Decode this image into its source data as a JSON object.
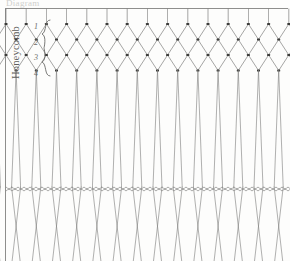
{
  "page": {
    "width": 290,
    "height": 261,
    "background_color": "#fdfdfc",
    "ink_color": "#6b6b69",
    "frame_color": "#8e8e8c"
  },
  "top_caption": {
    "text": "Diagram",
    "note": "faint cropped handwritten text at very top edge"
  },
  "side_label": {
    "text": "Honeycomb",
    "orientation": "vertical-rotated-90ccw"
  },
  "row_numbers": {
    "brace": "{",
    "items": [
      {
        "label": "1"
      },
      {
        "label": "2"
      },
      {
        "label": "3"
      },
      {
        "label": "4"
      }
    ]
  },
  "diagram": {
    "type": "netting-knot-diagram",
    "top_bar_y": 9,
    "lattice": {
      "rows": 4,
      "columns": 14,
      "cell_width": 20.2,
      "cell_height": 15.5,
      "first_knot_y": 24,
      "knot_color": "#3c3c3a",
      "line_color": "#7a7a78"
    },
    "hanging_strands": {
      "count": 15,
      "start_y": 71,
      "end_y": 261,
      "pair_splay_px": 9
    },
    "wavy_cords": {
      "count": 2,
      "y_positions": [
        187,
        191
      ],
      "amplitude": 1.6,
      "wavelength": 6,
      "color": "#8a8a88"
    }
  }
}
